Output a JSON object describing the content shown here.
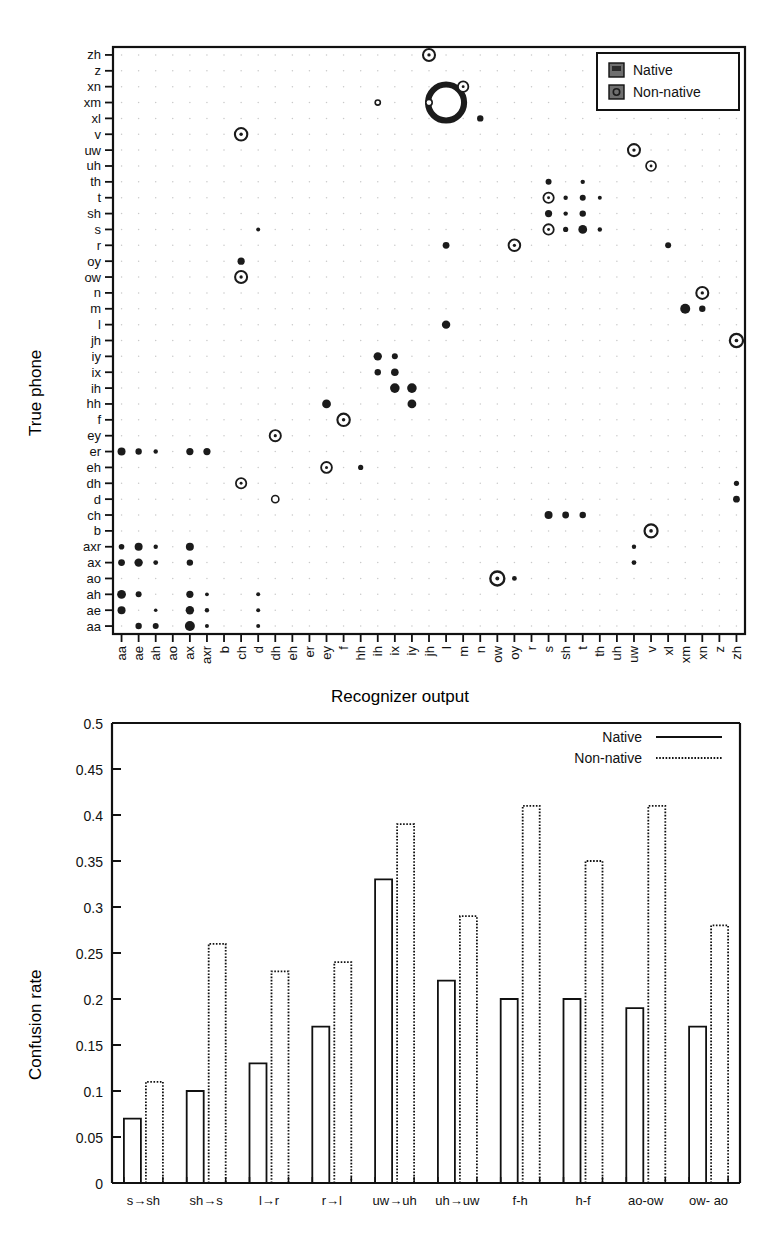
{
  "figures": {
    "scatter": {
      "name": "confusion-bubble-plot",
      "xlabel": "Recognizer output",
      "ylabel": "True phone",
      "legend": {
        "native_label": "Native",
        "nonnative_label": "Non-native"
      },
      "phones": [
        "aa",
        "ae",
        "ah",
        "ao",
        "ax",
        "axr",
        "b",
        "ch",
        "d",
        "dh",
        "eh",
        "er",
        "ey",
        "f",
        "hh",
        "ih",
        "ix",
        "iy",
        "jh",
        "l",
        "m",
        "n",
        "ow",
        "oy",
        "r",
        "s",
        "sh",
        "t",
        "th",
        "uh",
        "uw",
        "v",
        "xl",
        "xm",
        "xn",
        "z",
        "zh"
      ]
    },
    "bars": {
      "name": "confusion-rate-bar-chart",
      "ylabel": "Confusion rate",
      "legend": {
        "native_label": "Native",
        "nonnative_label": "Non-native"
      }
    }
  },
  "chart_data": [
    {
      "type": "scatter",
      "name": "phone-confusion-matrix",
      "title": "",
      "xlabel": "Recognizer output",
      "ylabel": "True phone",
      "grid": true,
      "legend_position": "top-right",
      "legend": [
        "Native",
        "Non-native"
      ],
      "categories_x": [
        "aa",
        "ae",
        "ah",
        "ao",
        "ax",
        "axr",
        "b",
        "ch",
        "d",
        "dh",
        "eh",
        "er",
        "ey",
        "f",
        "hh",
        "ih",
        "ix",
        "iy",
        "jh",
        "l",
        "m",
        "n",
        "ow",
        "oy",
        "r",
        "s",
        "sh",
        "t",
        "th",
        "uh",
        "uw",
        "v",
        "xl",
        "xm",
        "xn",
        "z",
        "zh"
      ],
      "categories_y": [
        "aa",
        "ae",
        "ah",
        "ao",
        "ax",
        "axr",
        "b",
        "ch",
        "d",
        "dh",
        "eh",
        "er",
        "ey",
        "f",
        "hh",
        "ih",
        "ix",
        "iy",
        "jh",
        "l",
        "m",
        "n",
        "ow",
        "oy",
        "r",
        "s",
        "sh",
        "t",
        "th",
        "uh",
        "uw",
        "v",
        "xl",
        "xm",
        "xn",
        "z",
        "zh"
      ],
      "note": "y axis is drawn bottom-to-top in the same alphabetical order; size encodes confusion magnitude; series 'native' = filled disc, series 'nonnative' = ring/open circle",
      "points": [
        {
          "x": "ae",
          "y": "aa",
          "series": "native",
          "size": 3.2
        },
        {
          "x": "ah",
          "y": "aa",
          "series": "native",
          "size": 3.0
        },
        {
          "x": "ax",
          "y": "aa",
          "series": "native",
          "size": 5.0
        },
        {
          "x": "axr",
          "y": "aa",
          "series": "native",
          "size": 2.0
        },
        {
          "x": "d",
          "y": "aa",
          "series": "native",
          "size": 2.0
        },
        {
          "x": "aa",
          "y": "ae",
          "series": "native",
          "size": 4.0
        },
        {
          "x": "ah",
          "y": "ae",
          "series": "native",
          "size": 1.8
        },
        {
          "x": "ax",
          "y": "ae",
          "series": "native",
          "size": 4.2
        },
        {
          "x": "axr",
          "y": "ae",
          "series": "native",
          "size": 2.2
        },
        {
          "x": "d",
          "y": "ae",
          "series": "native",
          "size": 2.0
        },
        {
          "x": "aa",
          "y": "ah",
          "series": "native",
          "size": 4.4
        },
        {
          "x": "ae",
          "y": "ah",
          "series": "native",
          "size": 3.0
        },
        {
          "x": "ax",
          "y": "ah",
          "series": "native",
          "size": 3.6
        },
        {
          "x": "axr",
          "y": "ah",
          "series": "native",
          "size": 1.9
        },
        {
          "x": "d",
          "y": "ah",
          "series": "native",
          "size": 2.0
        },
        {
          "x": "ow",
          "y": "ao",
          "series": "nonnative",
          "size": 7.0
        },
        {
          "x": "oy",
          "y": "ao",
          "series": "native",
          "size": 2.4
        },
        {
          "x": "aa",
          "y": "ax",
          "series": "native",
          "size": 3.4
        },
        {
          "x": "ae",
          "y": "ax",
          "series": "native",
          "size": 4.2
        },
        {
          "x": "ah",
          "y": "ax",
          "series": "native",
          "size": 2.4
        },
        {
          "x": "ax",
          "y": "ax",
          "series": "native",
          "size": 3.2
        },
        {
          "x": "uw",
          "y": "ax",
          "series": "native",
          "size": 2.4
        },
        {
          "x": "aa",
          "y": "axr",
          "series": "native",
          "size": 2.8
        },
        {
          "x": "ae",
          "y": "axr",
          "series": "native",
          "size": 4.0
        },
        {
          "x": "ah",
          "y": "axr",
          "series": "native",
          "size": 2.2
        },
        {
          "x": "ax",
          "y": "axr",
          "series": "native",
          "size": 4.0
        },
        {
          "x": "uw",
          "y": "axr",
          "series": "native",
          "size": 2.2
        },
        {
          "x": "v",
          "y": "b",
          "series": "nonnative",
          "size": 6.5
        },
        {
          "x": "s",
          "y": "ch",
          "series": "native",
          "size": 4.0
        },
        {
          "x": "sh",
          "y": "ch",
          "series": "native",
          "size": 3.4
        },
        {
          "x": "t",
          "y": "ch",
          "series": "native",
          "size": 3.2
        },
        {
          "x": "zh",
          "y": "d",
          "series": "native",
          "size": 3.4
        },
        {
          "x": "dh",
          "y": "d",
          "series": "nonnative",
          "size": 3.6
        },
        {
          "x": "ch",
          "y": "dh",
          "series": "nonnative",
          "size": 5.2
        },
        {
          "x": "zh",
          "y": "dh",
          "series": "native",
          "size": 2.6
        },
        {
          "x": "ey",
          "y": "eh",
          "series": "nonnative",
          "size": 5.4
        },
        {
          "x": "hh",
          "y": "eh",
          "series": "native",
          "size": 2.6
        },
        {
          "x": "aa",
          "y": "er",
          "series": "native",
          "size": 4.0
        },
        {
          "x": "ae",
          "y": "er",
          "series": "native",
          "size": 3.2
        },
        {
          "x": "ah",
          "y": "er",
          "series": "native",
          "size": 2.2
        },
        {
          "x": "ax",
          "y": "er",
          "series": "native",
          "size": 3.6
        },
        {
          "x": "axr",
          "y": "er",
          "series": "native",
          "size": 3.6
        },
        {
          "x": "dh",
          "y": "ey",
          "series": "nonnative",
          "size": 5.6
        },
        {
          "x": "f",
          "y": "f",
          "series": "nonnative",
          "size": 6.2
        },
        {
          "x": "ey",
          "y": "hh",
          "series": "native",
          "size": 4.4
        },
        {
          "x": "iy",
          "y": "hh",
          "series": "native",
          "size": 4.4
        },
        {
          "x": "ix",
          "y": "ih",
          "series": "native",
          "size": 4.8
        },
        {
          "x": "iy",
          "y": "ih",
          "series": "native",
          "size": 4.8
        },
        {
          "x": "ih",
          "y": "ix",
          "series": "native",
          "size": 3.2
        },
        {
          "x": "ix",
          "y": "ix",
          "series": "native",
          "size": 3.8
        },
        {
          "x": "ih",
          "y": "iy",
          "series": "native",
          "size": 4.2
        },
        {
          "x": "ix",
          "y": "iy",
          "series": "native",
          "size": 3.0
        },
        {
          "x": "zh",
          "y": "jh",
          "series": "nonnative",
          "size": 6.6
        },
        {
          "x": "l",
          "y": "l",
          "series": "native",
          "size": 4.2
        },
        {
          "x": "xm",
          "y": "m",
          "series": "native",
          "size": 5.0
        },
        {
          "x": "xn",
          "y": "m",
          "series": "native",
          "size": 3.2
        },
        {
          "x": "xn",
          "y": "n",
          "series": "nonnative",
          "size": 6.0
        },
        {
          "x": "ch",
          "y": "ow",
          "series": "nonnative",
          "size": 6.0
        },
        {
          "x": "ch",
          "y": "oy",
          "series": "native",
          "size": 3.6
        },
        {
          "x": "oy",
          "y": "r",
          "series": "nonnative",
          "size": 5.8
        },
        {
          "x": "l",
          "y": "r",
          "series": "native",
          "size": 3.4
        },
        {
          "x": "xl",
          "y": "r",
          "series": "native",
          "size": 3.0
        },
        {
          "x": "s",
          "y": "s",
          "series": "nonnative",
          "size": 5.2
        },
        {
          "x": "sh",
          "y": "s",
          "series": "native",
          "size": 2.6
        },
        {
          "x": "t",
          "y": "s",
          "series": "native",
          "size": 4.4
        },
        {
          "x": "th",
          "y": "s",
          "series": "native",
          "size": 2.2
        },
        {
          "x": "d",
          "y": "s",
          "series": "native",
          "size": 2.0
        },
        {
          "x": "s",
          "y": "sh",
          "series": "native",
          "size": 3.6
        },
        {
          "x": "sh",
          "y": "sh",
          "series": "native",
          "size": 2.2
        },
        {
          "x": "t",
          "y": "sh",
          "series": "native",
          "size": 3.2
        },
        {
          "x": "s",
          "y": "t",
          "series": "nonnative",
          "size": 5.2
        },
        {
          "x": "sh",
          "y": "t",
          "series": "native",
          "size": 2.2
        },
        {
          "x": "t",
          "y": "t",
          "series": "native",
          "size": 3.0
        },
        {
          "x": "th",
          "y": "t",
          "series": "native",
          "size": 2.0
        },
        {
          "x": "s",
          "y": "th",
          "series": "native",
          "size": 3.0
        },
        {
          "x": "t",
          "y": "th",
          "series": "native",
          "size": 2.2
        },
        {
          "x": "v",
          "y": "uh",
          "series": "nonnative",
          "size": 5.0
        },
        {
          "x": "uw",
          "y": "uw",
          "series": "nonnative",
          "size": 6.0
        },
        {
          "x": "ch",
          "y": "v",
          "series": "nonnative",
          "size": 6.2
        },
        {
          "x": "n",
          "y": "xl",
          "series": "native",
          "size": 3.2
        },
        {
          "x": "l",
          "y": "xm",
          "series": "nonnative",
          "size": 18.0
        },
        {
          "x": "jh",
          "y": "xm",
          "series": "nonnative",
          "size": 3.2
        },
        {
          "x": "ih",
          "y": "xm",
          "series": "nonnative",
          "size": 2.6
        },
        {
          "x": "m",
          "y": "xn",
          "series": "nonnative",
          "size": 5.2
        },
        {
          "x": "jh",
          "y": "zh",
          "series": "nonnative",
          "size": 6.0
        }
      ]
    },
    {
      "type": "bar",
      "name": "confusion-rate-by-pair",
      "title": "",
      "xlabel": "",
      "ylabel": "Confusion rate",
      "ylim": [
        0,
        0.5
      ],
      "yticks": [
        "0",
        "0.05",
        "0.1",
        "0.15",
        "0.2",
        "0.25",
        "0.3",
        "0.35",
        "0.4",
        "0.45",
        "0.5"
      ],
      "ytick_values": [
        0,
        0.05,
        0.1,
        0.15,
        0.2,
        0.25,
        0.3,
        0.35,
        0.4,
        0.45,
        0.5
      ],
      "grid": false,
      "legend_position": "top-right",
      "categories": [
        "s→sh",
        "sh→s",
        "l→r",
        "r→l",
        "uw→uh",
        "uh→uw",
        "f-h",
        "h-f",
        "ao-ow",
        "ow- ao"
      ],
      "series": [
        {
          "name": "Native",
          "style": "solid",
          "values": [
            0.07,
            0.1,
            0.13,
            0.17,
            0.33,
            0.22,
            0.2,
            0.2,
            0.19,
            0.17
          ]
        },
        {
          "name": "Non-native",
          "style": "dotted",
          "values": [
            0.11,
            0.26,
            0.23,
            0.24,
            0.39,
            0.29,
            0.41,
            0.35,
            0.41,
            0.28
          ]
        }
      ]
    }
  ]
}
